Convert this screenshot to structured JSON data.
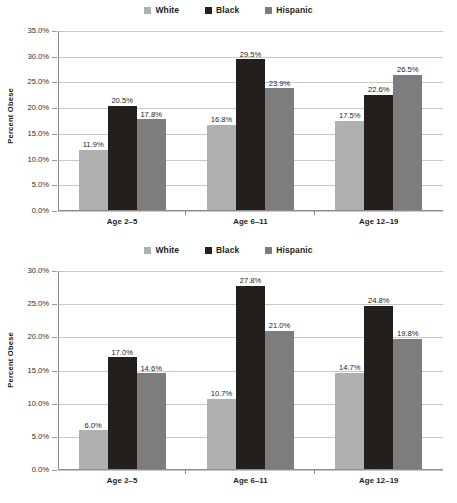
{
  "charts": [
    {
      "id": "top",
      "legend": [
        {
          "label": "White",
          "color": "#b0b0b0"
        },
        {
          "label": "Black",
          "color": "#231f1c"
        },
        {
          "label": "Hispanic",
          "color": "#7d7d7d"
        }
      ],
      "ylabel": "Percent Obese",
      "ytick_labels": [
        "35.0%",
        "30.0%",
        "25.0%",
        "20.0%",
        "15.0%",
        "10.0%",
        "5.0%",
        "0.0%"
      ],
      "ytick_values": [
        35,
        30,
        25,
        20,
        15,
        10,
        5,
        0
      ],
      "categories": [
        "Age 2–5",
        "Age 6–11",
        "Age 12–19"
      ],
      "values": [
        [
          "11.9%",
          "20.5%",
          "17.8%"
        ],
        [
          "16.8%",
          "29.5%",
          "23.9%"
        ],
        [
          "17.5%",
          "22.6%",
          "26.5%"
        ]
      ]
    },
    {
      "id": "bottom",
      "legend": [
        {
          "label": "White",
          "color": "#b0b0b0"
        },
        {
          "label": "Black",
          "color": "#231f1c"
        },
        {
          "label": "Hispanic",
          "color": "#7d7d7d"
        }
      ],
      "ylabel": "Percent Obese",
      "ytick_labels": [
        "30.0%",
        "25.0%",
        "20.0%",
        "15.0%",
        "10.0%",
        "5.0%",
        "0.0%"
      ],
      "ytick_values": [
        30,
        25,
        20,
        15,
        10,
        5,
        0
      ],
      "categories": [
        "Age 2–5",
        "Age 6–11",
        "Age 12–19"
      ],
      "values": [
        [
          "6.0%",
          "17.0%",
          "14.6%"
        ],
        [
          "10.7%",
          "27.8%",
          "21.0%"
        ],
        [
          "14.7%",
          "24.8%",
          "19.8%"
        ]
      ]
    }
  ],
  "chart_data": [
    {
      "type": "bar",
      "title": "",
      "xlabel": "",
      "ylabel": "Percent Obese",
      "categories": [
        "Age 2–5",
        "Age 6–11",
        "Age 12–19"
      ],
      "series": [
        {
          "name": "White",
          "values": [
            11.9,
            16.8,
            17.5
          ],
          "color": "#b0b0b0"
        },
        {
          "name": "Black",
          "values": [
            20.5,
            29.5,
            22.6
          ],
          "color": "#231f1c"
        },
        {
          "name": "Hispanic",
          "values": [
            17.8,
            23.9,
            26.5
          ],
          "color": "#7d7d7d"
        }
      ],
      "ylim": [
        0,
        35
      ],
      "ytick_values": [
        0,
        5,
        10,
        15,
        20,
        25,
        30,
        35
      ],
      "ytick_labels": [
        "0.0%",
        "5.0%",
        "10.0%",
        "15.0%",
        "20.0%",
        "25.0%",
        "30.0%",
        "35.0%"
      ],
      "grid": true,
      "legend_position": "top-center",
      "data_labels": true
    },
    {
      "type": "bar",
      "title": "",
      "xlabel": "",
      "ylabel": "Percent Obese",
      "categories": [
        "Age 2–5",
        "Age 6–11",
        "Age 12–19"
      ],
      "series": [
        {
          "name": "White",
          "values": [
            6.0,
            10.7,
            14.7
          ],
          "color": "#b0b0b0"
        },
        {
          "name": "Black",
          "values": [
            17.0,
            27.8,
            24.8
          ],
          "color": "#231f1c"
        },
        {
          "name": "Hispanic",
          "values": [
            14.6,
            21.0,
            19.8
          ],
          "color": "#7d7d7d"
        }
      ],
      "ylim": [
        0,
        30
      ],
      "ytick_values": [
        0,
        5,
        10,
        15,
        20,
        25,
        30
      ],
      "ytick_labels": [
        "0.0%",
        "5.0%",
        "10.0%",
        "15.0%",
        "20.0%",
        "25.0%",
        "30.0%"
      ],
      "grid": true,
      "legend_position": "top-center",
      "data_labels": true
    }
  ]
}
